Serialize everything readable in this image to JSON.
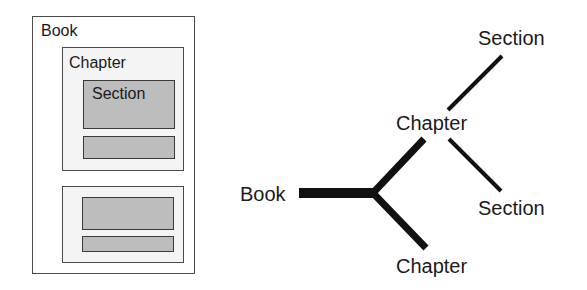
{
  "nested_view": {
    "book": {
      "label": "Book"
    },
    "chapters": [
      {
        "label": "Chapter",
        "sections": [
          {
            "label": "Section"
          },
          {
            "label": ""
          }
        ]
      },
      {
        "label": "",
        "sections": [
          {
            "label": ""
          },
          {
            "label": ""
          }
        ]
      }
    ]
  },
  "tree_view": {
    "root": {
      "label": "Book"
    },
    "chapters": [
      {
        "label": "Chapter",
        "sections": [
          {
            "label": "Section"
          },
          {
            "label": "Section"
          }
        ]
      },
      {
        "label": "Chapter"
      }
    ]
  },
  "colors": {
    "border": "#4a4a4a",
    "chapter_fill": "#f4f4f4",
    "section_fill": "#bdbdbd",
    "line": "#111111"
  }
}
